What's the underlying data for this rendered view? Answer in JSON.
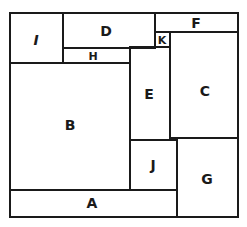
{
  "diagram": {
    "type": "rectangle-partition",
    "regions": [
      {
        "id": "I",
        "label": "I"
      },
      {
        "id": "D",
        "label": "D"
      },
      {
        "id": "H",
        "label": "H"
      },
      {
        "id": "F",
        "label": "F"
      },
      {
        "id": "K",
        "label": "K"
      },
      {
        "id": "E",
        "label": "E"
      },
      {
        "id": "C",
        "label": "C"
      },
      {
        "id": "B",
        "label": "B"
      },
      {
        "id": "J",
        "label": "J"
      },
      {
        "id": "G",
        "label": "G"
      },
      {
        "id": "A",
        "label": "A"
      }
    ],
    "colors": {
      "line": "#1a1a1a",
      "background": "#ffffff"
    }
  }
}
